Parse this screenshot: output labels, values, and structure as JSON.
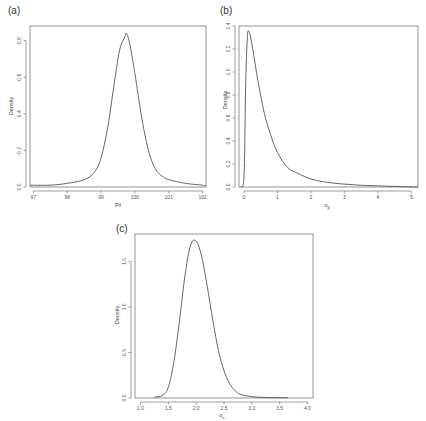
{
  "chart_data": [
    {
      "panel": "(a)",
      "type": "line",
      "title": "",
      "xlabel": "Pil",
      "ylabel": "Density",
      "xlim": [
        96.9,
        102.1
      ],
      "ylim": [
        0.0,
        0.88
      ],
      "xticks": [
        "97",
        "98",
        "99",
        "100",
        "101",
        "102"
      ],
      "yticks": [
        "0.0",
        "0.2",
        "0.4",
        "0.6",
        "0.8"
      ],
      "grid": false,
      "x": [
        96.9,
        97.5,
        98.0,
        98.5,
        98.8,
        99.0,
        99.2,
        99.4,
        99.55,
        99.7,
        99.75,
        99.85,
        100.0,
        100.2,
        100.4,
        100.6,
        100.8,
        101.0,
        101.5,
        102.0,
        102.1
      ],
      "values": [
        0.01,
        0.01,
        0.02,
        0.04,
        0.08,
        0.16,
        0.33,
        0.58,
        0.75,
        0.82,
        0.84,
        0.78,
        0.62,
        0.38,
        0.2,
        0.1,
        0.06,
        0.04,
        0.02,
        0.01,
        0.005
      ]
    },
    {
      "panel": "(b)",
      "type": "line",
      "title": "",
      "xlabel": "σ_β",
      "ylabel": "Density",
      "xlim": [
        -0.15,
        5.2
      ],
      "ylim": [
        0.0,
        1.4
      ],
      "xticks": [
        "0",
        "1",
        "2",
        "3",
        "4",
        "5"
      ],
      "yticks": [
        "0.0",
        "0.2",
        "0.4",
        "0.6",
        "0.8",
        "1.0",
        "1.2",
        "1.4"
      ],
      "grid": false,
      "x": [
        -0.1,
        0.0,
        0.05,
        0.1,
        0.15,
        0.25,
        0.4,
        0.6,
        0.8,
        1.0,
        1.3,
        1.6,
        2.0,
        2.5,
        3.0,
        3.5,
        4.0,
        4.5,
        5.2
      ],
      "values": [
        0.0,
        0.1,
        0.9,
        1.3,
        1.35,
        1.22,
        0.95,
        0.65,
        0.45,
        0.3,
        0.17,
        0.12,
        0.07,
        0.04,
        0.025,
        0.015,
        0.01,
        0.005,
        0.0
      ]
    },
    {
      "panel": "(c)",
      "type": "line",
      "title": "",
      "xlabel": "σ_e",
      "ylabel": "Density",
      "xlim": [
        0.9,
        4.1
      ],
      "ylim": [
        0.0,
        1.8
      ],
      "xticks": [
        "1.0",
        "1.5",
        "2.0",
        "2.5",
        "3.0",
        "3.5",
        "4.0"
      ],
      "yticks": [
        "0.0",
        "0.5",
        "1.0",
        "1.5"
      ],
      "grid": false,
      "x": [
        1.25,
        1.4,
        1.5,
        1.6,
        1.7,
        1.8,
        1.9,
        2.0,
        2.1,
        2.2,
        2.3,
        2.4,
        2.5,
        2.6,
        2.7,
        2.8,
        3.0,
        3.2,
        3.4,
        3.65
      ],
      "values": [
        0.01,
        0.03,
        0.12,
        0.4,
        0.85,
        1.35,
        1.68,
        1.72,
        1.55,
        1.22,
        0.85,
        0.52,
        0.3,
        0.16,
        0.08,
        0.04,
        0.015,
        0.007,
        0.004,
        0.003
      ]
    }
  ],
  "panels": {
    "a": {
      "label": "(a)",
      "xlabel": "Pil",
      "ylabel": "Density"
    },
    "b": {
      "label": "(b)",
      "xlabel": "σ",
      "xlabel_sub": "β",
      "ylabel": "Density"
    },
    "c": {
      "label": "(c)",
      "xlabel": "σ",
      "xlabel_sub": "e",
      "ylabel": "Density"
    }
  }
}
